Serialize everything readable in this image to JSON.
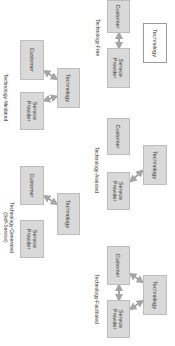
{
  "diagram": {
    "orientation": "rotated 90 degrees clockwise",
    "panels": [
      {
        "id": "technology-free",
        "label": "Technology-Free",
        "nodes": {
          "technology": "Technology",
          "customer": "Customer",
          "provider": "Service Provider"
        },
        "connections": [
          "customer<->provider"
        ],
        "technology_style": "white-outline"
      },
      {
        "id": "technology-assisted",
        "label": "Technology-Assisted",
        "nodes": {
          "technology": "Technology",
          "customer": "Customer",
          "provider": "Service Provider"
        },
        "connections": [
          "provider<->technology"
        ]
      },
      {
        "id": "technology-facilitated",
        "label": "Technology-Facilitated",
        "nodes": {
          "technology": "Technology",
          "customer": "Customer",
          "provider": "Service Provider"
        },
        "connections": [
          "customer<->provider",
          "customer<->technology",
          "provider<->technology"
        ]
      },
      {
        "id": "technology-mediated",
        "label": "Technology-Mediated",
        "nodes": {
          "technology": "Technology",
          "customer": "Customer",
          "provider": "Service Provider"
        },
        "connections": [
          "customer<->technology",
          "provider<->technology"
        ]
      },
      {
        "id": "technology-generated",
        "label": "Technology-Generated",
        "label_line2": "(Self-Service)",
        "nodes": {
          "technology": "Technology",
          "customer": "Customer",
          "provider": "Service Provider"
        },
        "connections": [
          "customer<->technology"
        ]
      }
    ],
    "colors": {
      "box_fill": "#d9d9d9",
      "box_border": "#bdbdbd",
      "arrow": "#a6a6a6",
      "text": "#333333"
    }
  }
}
